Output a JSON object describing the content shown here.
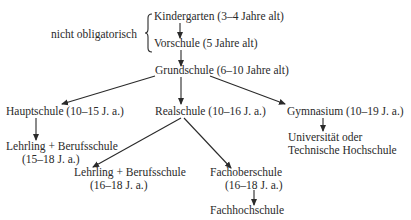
{
  "diagram": {
    "bracket_label": "nicht obligatorisch",
    "nodes": {
      "kindergarten": "Kindergarten (3–4 Jahre alt)",
      "vorschule": "Vorschule (5 Jahre alt)",
      "grundschule": "Grundschule (6–10 Jahre alt)",
      "hauptschule": "Hauptschule (10–15 J. a.)",
      "realschule": "Realschule (10–16 J. a.)",
      "gymnasium": "Gymnasium (10–19 J. a.)",
      "lehrling1_line1": "Lehrling + Berufsschule",
      "lehrling1_line2": "(15–18 J. a.)",
      "lehrling2_line1": "Lehrling + Berufsschule",
      "lehrling2_line2": "(16–18 J. a.)",
      "fachoberschule_line1": "Fachoberschule",
      "fachoberschule_line2": "(16–18 J. a.)",
      "fachhochschule": "Fachhochschule",
      "universitaet_line1": "Universität oder",
      "universitaet_line2": "Technische Hochschule"
    },
    "edges": [
      [
        "kindergarten",
        "vorschule"
      ],
      [
        "vorschule",
        "grundschule"
      ],
      [
        "grundschule",
        "hauptschule"
      ],
      [
        "grundschule",
        "realschule"
      ],
      [
        "grundschule",
        "gymnasium"
      ],
      [
        "hauptschule",
        "lehrling1"
      ],
      [
        "realschule",
        "lehrling2"
      ],
      [
        "realschule",
        "fachoberschule"
      ],
      [
        "fachoberschule",
        "fachhochschule"
      ],
      [
        "gymnasium",
        "universitaet"
      ]
    ],
    "line_color": "#2a2a2a"
  }
}
